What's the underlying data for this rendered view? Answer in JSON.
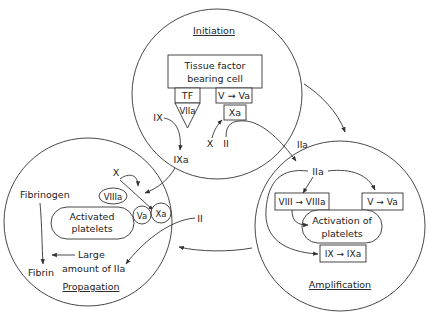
{
  "colors": {
    "line": "#333333",
    "text": "#222222",
    "background": "#ffffff"
  },
  "initiation": {
    "title": "Initiation",
    "cell_line1": "Tissue factor",
    "cell_line2": "bearing cell",
    "tf": "TF",
    "viia": "VIIa",
    "v_to_va": "V → Va",
    "xa": "Xa",
    "ix": "IX",
    "ixa": "IXa",
    "x": "X",
    "ii": "II"
  },
  "transfer": {
    "iia": "IIa",
    "ii": "II"
  },
  "propagation": {
    "title": "Propagation",
    "x": "X",
    "viiia": "VIIIa",
    "platelets_line1": "Activated",
    "platelets_line2": "platelets",
    "va": "Va",
    "xa": "Xa",
    "fibrinogen": "Fibrinogen",
    "fibrin": "Fibrin",
    "large_line1": "Large",
    "large_line2": "amount of IIa"
  },
  "amplification": {
    "title": "Amplification",
    "iia": "IIa",
    "viii_to_viiia": "VIII → VIIIa",
    "v_to_va": "V → Va",
    "activation_line1": "Activation of",
    "activation_line2": "platelets",
    "ix_to_ixa": "IX → IXa"
  }
}
